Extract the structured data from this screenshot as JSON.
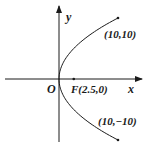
{
  "diagram": {
    "type": "parabola",
    "equation": "y^2 = 10x",
    "axis_labels": {
      "x": "x",
      "y": "y"
    },
    "origin_label": "O",
    "focus": {
      "label": "F(2.5,0)",
      "x": 2.5,
      "y": 0
    },
    "endpoints": [
      {
        "label": "(10,10)",
        "x": 10,
        "y": 10
      },
      {
        "label": "(10,−10)",
        "x": 10,
        "y": -10
      }
    ],
    "colors": {
      "stroke": "#1a1a1a",
      "background": "#ffffff"
    }
  }
}
